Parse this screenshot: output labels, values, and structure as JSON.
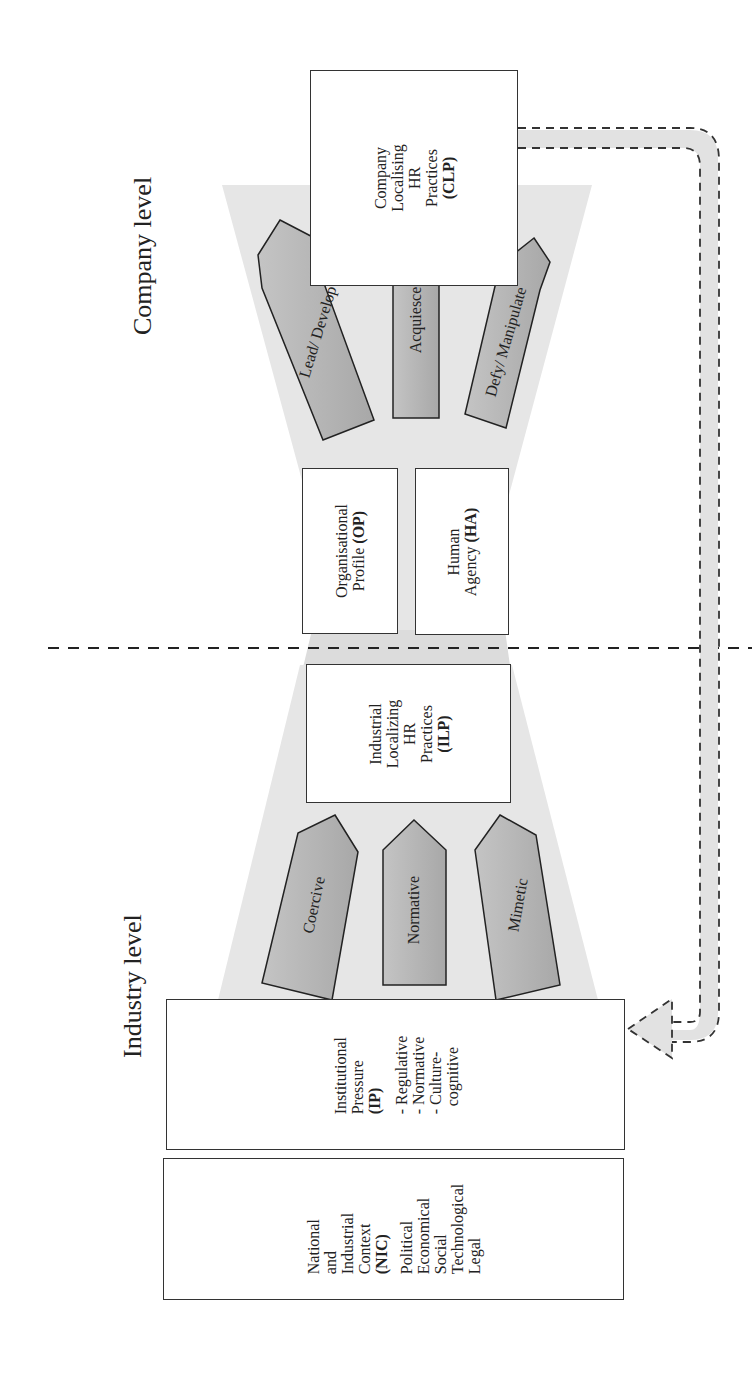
{
  "levels": {
    "company": "Company level",
    "industry": "Industry level"
  },
  "boxes": {
    "clp": {
      "lines": [
        "Company",
        "Localising",
        "HR",
        "Practices"
      ],
      "abbr": "(CLP)"
    },
    "op": {
      "lines": [
        "Organisational",
        "Profile "
      ],
      "abbr": "(OP)"
    },
    "ha": {
      "lines": [
        "Human",
        "Agency "
      ],
      "abbr": "(HA)"
    },
    "ilp": {
      "lines": [
        "Industrial",
        "Localizing",
        "HR",
        "Practices"
      ],
      "abbr": "(ILP)"
    },
    "ip": {
      "lines": [
        "Institutional",
        "Pressure"
      ],
      "abbr": "(IP)",
      "items": [
        "- Regulative",
        "- Normative",
        "- Culture-",
        "  cognitive"
      ]
    },
    "nic": {
      "lines": [
        "National",
        "and",
        "Industrial",
        "Context"
      ],
      "abbr": "(NIC)",
      "items": [
        "Political",
        "Economical",
        "Social",
        "Technological",
        "Legal"
      ]
    }
  },
  "company_responses": [
    "Lead/ Develop",
    "Acquiesce",
    "Defy/ Manipulate"
  ],
  "industry_mechanisms": [
    "Coercive",
    "Normative",
    "Mimetic"
  ],
  "colors": {
    "funnel": "#e6e6e6",
    "arrow_fill": "#b8b8b8",
    "stroke": "#333333",
    "feedback": "#e2e2e2"
  }
}
